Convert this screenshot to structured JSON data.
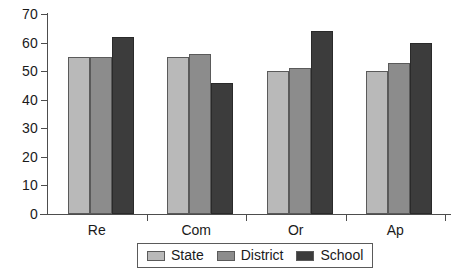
{
  "chart_data": {
    "type": "bar",
    "title": "",
    "subtitle": "",
    "xlabel": "",
    "ylabel": "",
    "categories": [
      "Re",
      "Com",
      "Or",
      "Ap"
    ],
    "series": [
      {
        "name": "State",
        "color": "#b9b9b9",
        "values": [
          55,
          55,
          50,
          50
        ]
      },
      {
        "name": "District",
        "color": "#8c8c8c",
        "values": [
          55,
          56,
          51,
          53
        ]
      },
      {
        "name": "School",
        "color": "#3c3c3c",
        "values": [
          62,
          46,
          64,
          60
        ]
      }
    ],
    "ylim": [
      0,
      70
    ],
    "ytick_step": 10,
    "yticks": [
      "70",
      "60",
      "50",
      "40",
      "30",
      "20",
      "10",
      "0"
    ],
    "grid": false,
    "legend_position": "bottom-center",
    "axis_color": "#4d4d4d",
    "background_color": "#ffffff"
  },
  "legend": {
    "entries": [
      {
        "label": "State"
      },
      {
        "label": "District"
      },
      {
        "label": "School"
      }
    ]
  }
}
